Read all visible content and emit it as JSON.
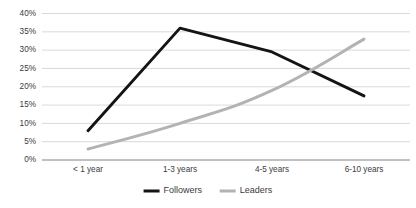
{
  "chart_data": {
    "type": "line",
    "title": "",
    "subtitle": "",
    "xlabel": "",
    "ylabel": "",
    "categories": [
      "< 1 year",
      "1-3 years",
      "4-5 years",
      "6-10 years"
    ],
    "series": [
      {
        "name": "Followers",
        "color": "#141414",
        "values": [
          8,
          36,
          29.5,
          17.5
        ]
      },
      {
        "name": "Leaders",
        "color": "#b3b3b3",
        "values": [
          3,
          10,
          19,
          33
        ]
      }
    ],
    "ylim": [
      0,
      40
    ],
    "ytick_values": [
      0,
      5,
      10,
      15,
      20,
      25,
      30,
      35,
      40
    ],
    "ytick_labels": [
      "0%",
      "5%",
      "10%",
      "15%",
      "20%",
      "25%",
      "30%",
      "35%",
      "40%"
    ],
    "grid": true,
    "legend_position": "bottom-center",
    "value_format": "percent"
  },
  "legend": {
    "entries": [
      {
        "label": "Followers",
        "color": "#141414"
      },
      {
        "label": "Leaders",
        "color": "#b3b3b3"
      }
    ]
  }
}
